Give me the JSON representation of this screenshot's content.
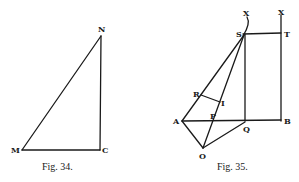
{
  "figures": [
    {
      "caption": "Fig. 34.",
      "labels": {
        "N": "N",
        "M": "M",
        "C": "C"
      }
    },
    {
      "caption": "Fig. 35.",
      "labels": {
        "X1": "X",
        "X2": "X",
        "S": "S",
        "T": "T",
        "R": "R",
        "I": "I",
        "A": "A",
        "P": "P",
        "Q": "Q",
        "B": "B",
        "O": "O"
      }
    }
  ]
}
